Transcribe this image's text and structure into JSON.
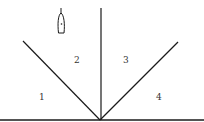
{
  "diagram": {
    "regions": [
      {
        "label": "1",
        "x": 40,
        "y": 99
      },
      {
        "label": "2",
        "x": 76,
        "y": 62
      },
      {
        "label": "3",
        "x": 125,
        "y": 62
      },
      {
        "label": "4",
        "x": 158,
        "y": 99
      }
    ],
    "colors": {
      "line": "#1a1a1a",
      "text": "#333333",
      "background": "#ffffff"
    }
  }
}
